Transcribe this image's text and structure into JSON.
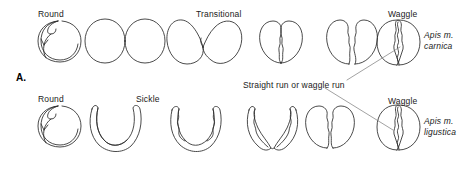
{
  "figure": {
    "panel_label": "A.",
    "background_color": "#ffffff",
    "ink_color": "#2b2b2b",
    "leader_color": "#7a7a7a"
  },
  "rows": [
    {
      "species": "Apis m.",
      "species_line2": "carnica",
      "labels": [
        {
          "text": "Round",
          "x": 38,
          "y": 9
        },
        {
          "text": "Transitional",
          "x": 196,
          "y": 9
        },
        {
          "text": "Waggle",
          "x": 388,
          "y": 9
        }
      ],
      "figures": [
        {
          "name": "round-dance",
          "kind": "round"
        },
        {
          "name": "figure-eight-dance",
          "kind": "eight"
        },
        {
          "name": "transitional-dance-1",
          "kind": "transitional-1"
        },
        {
          "name": "transitional-dance-2",
          "kind": "transitional-2"
        },
        {
          "name": "transitional-dance-3",
          "kind": "transitional-3"
        },
        {
          "name": "waggle-dance",
          "kind": "waggle"
        }
      ]
    },
    {
      "species": "Apis m.",
      "species_line2": "ligustica",
      "labels": [
        {
          "text": "Round",
          "x": 38,
          "y": 94
        },
        {
          "text": "Sickle",
          "x": 136,
          "y": 94
        },
        {
          "text": "Waggle",
          "x": 388,
          "y": 96
        }
      ],
      "figures": [
        {
          "name": "round-dance",
          "kind": "round"
        },
        {
          "name": "sickle-dance",
          "kind": "sickle"
        },
        {
          "name": "sickle-transitional-1",
          "kind": "sickle-2"
        },
        {
          "name": "sickle-transitional-2",
          "kind": "sickle-3"
        },
        {
          "name": "sickle-transitional-3",
          "kind": "sickle-4"
        },
        {
          "name": "waggle-dance",
          "kind": "waggle"
        }
      ]
    }
  ],
  "annotation": {
    "text": "Straight run or waggle run",
    "x": 243,
    "y": 80
  }
}
